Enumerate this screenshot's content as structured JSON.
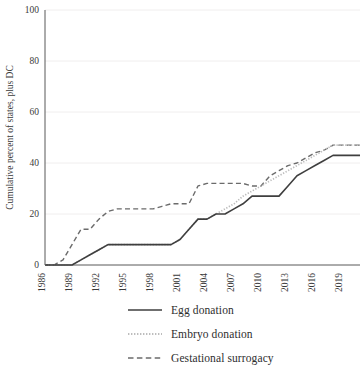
{
  "chart_data": {
    "type": "line",
    "title": "",
    "xlabel": "",
    "ylabel": "Cumulative percent of states, plus DC",
    "xlim": [
      1986,
      2021
    ],
    "ylim": [
      0,
      100
    ],
    "ytick_labels": [
      "0",
      "20",
      "40",
      "60",
      "80",
      "100"
    ],
    "ytick_values": [
      0,
      20,
      40,
      60,
      80,
      100
    ],
    "xtick_labels": [
      "1986",
      "1989",
      "1992",
      "1995",
      "1998",
      "2001",
      "2004",
      "2007",
      "2010",
      "2013",
      "2016",
      "2019"
    ],
    "xtick_values": [
      1986,
      1989,
      1992,
      1995,
      1998,
      2001,
      2004,
      2007,
      2010,
      2013,
      2016,
      2019
    ],
    "grid": true,
    "legend_position": "bottom",
    "x": [
      1986,
      1987,
      1988,
      1989,
      1990,
      1991,
      1992,
      1993,
      1994,
      1995,
      1996,
      1997,
      1998,
      1999,
      2000,
      2001,
      2002,
      2003,
      2004,
      2005,
      2006,
      2007,
      2008,
      2009,
      2010,
      2011,
      2012,
      2013,
      2014,
      2015,
      2016,
      2017,
      2018,
      2019,
      2020,
      2021
    ],
    "series": [
      {
        "name": "Egg donation",
        "style": "solid",
        "color": "#3f3f3f",
        "values": [
          0,
          0,
          0,
          0,
          2,
          4,
          6,
          8,
          8,
          8,
          8,
          8,
          8,
          8,
          8,
          10,
          14,
          18,
          18,
          20,
          20,
          22,
          24,
          27,
          27,
          27,
          27,
          31,
          35,
          37,
          39,
          41,
          43,
          43,
          43,
          43
        ]
      },
      {
        "name": "Embryo donation",
        "style": "dotted",
        "color": "#bdbdbd",
        "values": [
          0,
          0,
          0,
          0,
          2,
          4,
          6,
          8,
          8,
          8,
          8,
          8,
          8,
          8,
          8,
          10,
          14,
          18,
          18,
          20,
          22,
          24,
          27,
          29,
          31,
          33,
          35,
          37,
          39,
          41,
          43,
          45,
          47,
          47,
          47,
          47
        ]
      },
      {
        "name": "Gestational surrogacy",
        "style": "dashed",
        "color": "#6b6b6b",
        "values": [
          0,
          0,
          2,
          8,
          14,
          14,
          18,
          21,
          22,
          22,
          22,
          22,
          22,
          23,
          24,
          24,
          24,
          31,
          32,
          32,
          32,
          32,
          32,
          31,
          31,
          35,
          37,
          39,
          40,
          42,
          44,
          45,
          47,
          47,
          47,
          47
        ]
      }
    ]
  },
  "legend": {
    "items": [
      {
        "label": "Egg donation",
        "swatch": "solid-line-swatch"
      },
      {
        "label": "Embryo donation",
        "swatch": "dotted-line-swatch"
      },
      {
        "label": "Gestational surrogacy",
        "swatch": "dashed-line-swatch"
      }
    ]
  }
}
